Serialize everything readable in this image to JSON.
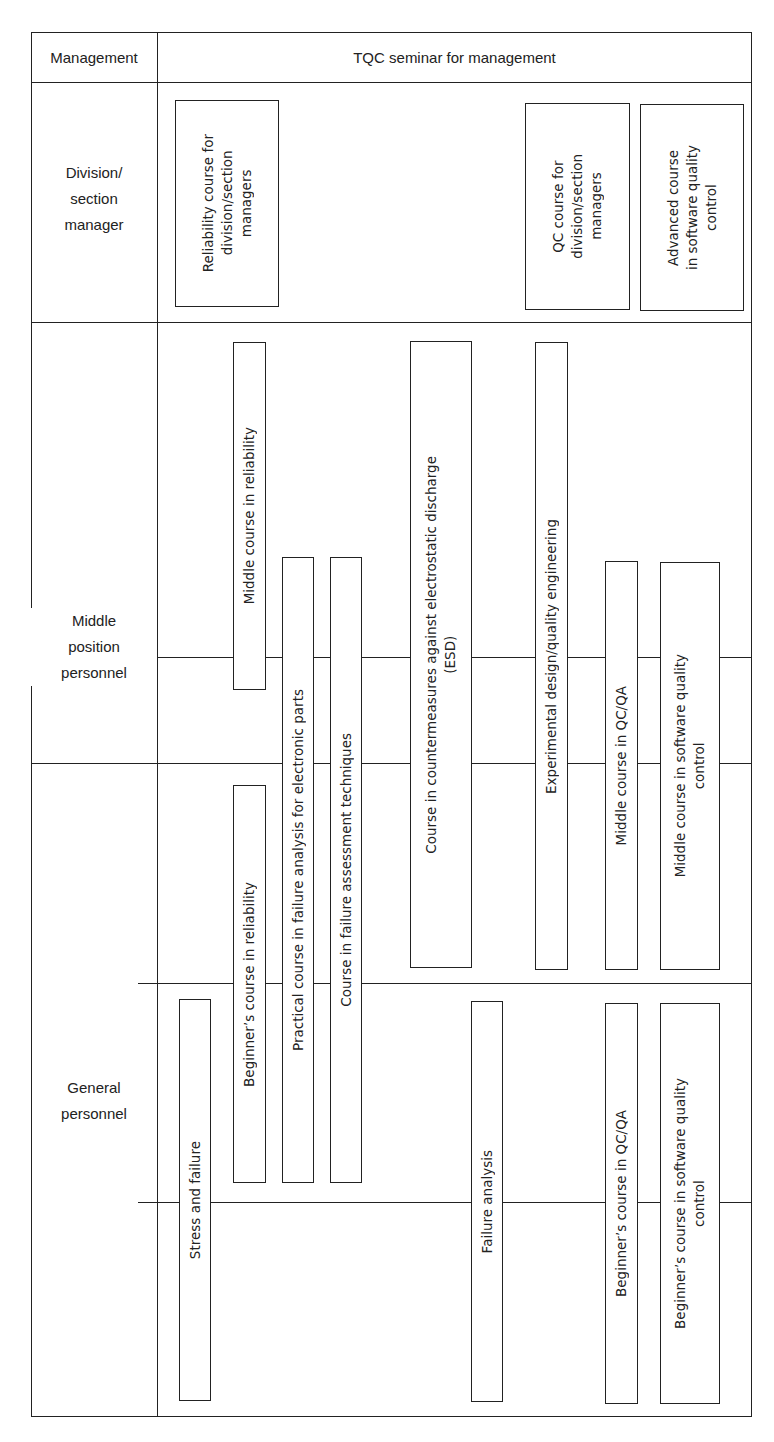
{
  "header": {
    "left": "Management",
    "right": "TQC seminar for management"
  },
  "rows": [
    {
      "id": "division",
      "label": "Division/\nsection\nmanager"
    },
    {
      "id": "middle",
      "label": "Middle\nposition\npersonnel"
    },
    {
      "id": "general",
      "label": "General\npersonnel"
    }
  ],
  "courses": [
    {
      "id": "reliability-division",
      "label": "Reliability course for\ndivision/section\nmanagers"
    },
    {
      "id": "qc-division",
      "label": "QC course for\ndivision/section\nmanagers"
    },
    {
      "id": "advanced-software",
      "label": "Advanced course\nin software quality\ncontrol"
    },
    {
      "id": "middle-reliability",
      "label": "Middle course in reliability"
    },
    {
      "id": "practical-failure",
      "label": "Practical course in failure analysis for electronic parts"
    },
    {
      "id": "failure-assessment",
      "label": "Course in failure assessment techniques"
    },
    {
      "id": "esd",
      "label": "Course in countermeasures against electrostatic discharge\n(ESD)"
    },
    {
      "id": "experimental-design",
      "label": "Experimental design/quality engineering"
    },
    {
      "id": "middle-qcqa",
      "label": "Middle course in QC/QA"
    },
    {
      "id": "middle-software",
      "label": "Middle course in software quality\ncontrol"
    },
    {
      "id": "beginner-reliability",
      "label": "Beginner’s course in reliability"
    },
    {
      "id": "stress-failure",
      "label": "Stress and failure"
    },
    {
      "id": "failure-analysis",
      "label": "Failure analysis"
    },
    {
      "id": "beginner-qcqa",
      "label": "Beginner’s course in QC/QA"
    },
    {
      "id": "beginner-software",
      "label": "Beginner’s course in software quality\ncontrol"
    }
  ]
}
